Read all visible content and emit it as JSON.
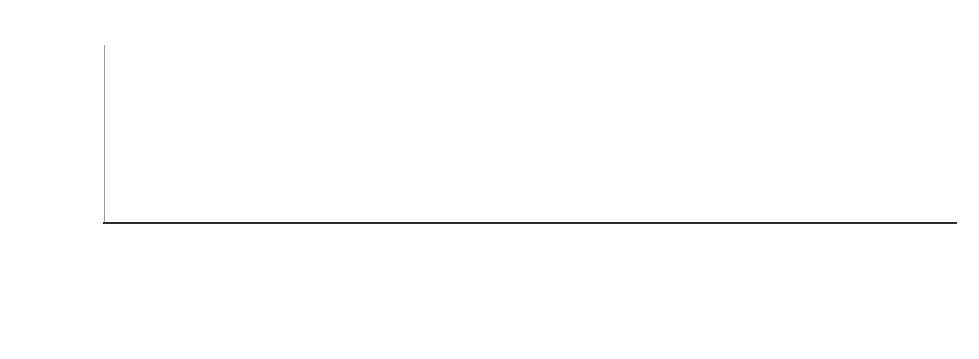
{
  "chart_data": {
    "type": "bar",
    "subtype": "stacked-bar-percent",
    "title": "",
    "xlabel": "",
    "ylabel": "",
    "ylim": [
      0,
      100
    ],
    "ytick_labels": [
      "0%",
      "20%",
      "40%",
      "60%",
      "80%",
      "100%"
    ],
    "ytick_values": [
      0,
      20,
      40,
      60,
      80,
      100
    ],
    "grid": false,
    "legend_position": "top-left",
    "categories": [
      "Zero Hunger",
      "Sustainable Cities and Communities",
      "Responsible Consumption and Production",
      "Reduced Inequalities",
      "Quality Education",
      "Peace, Justice and Strong Institutions",
      "Partnerships for the Goals",
      "No Poverty",
      "Life on Land",
      "Life Below Water",
      "Industry, Innovation and Infrastructure",
      "Good Health and Well Being",
      "Gender Equality",
      "Decent Work and Economic Growth",
      "Climate Action",
      "Clean Water and Sanitation",
      "Affordable and Clean Energy"
    ],
    "series": [
      {
        "name": "STEM",
        "color": "#808080",
        "values": [
          77,
          28,
          41,
          35,
          33,
          13,
          26,
          21,
          59,
          75,
          45,
          91,
          22,
          9,
          72,
          65,
          86
        ]
      },
      {
        "name": "SocSci",
        "color": "#a9a9a9",
        "values": [
          21,
          70,
          57,
          64,
          65,
          86,
          73,
          78,
          40,
          24,
          54,
          7,
          77,
          90,
          27,
          34,
          14
        ]
      },
      {
        "name": "SocSciSTEM",
        "color": "#bfbfbf",
        "values": [
          2,
          2,
          2,
          1,
          2,
          1,
          1,
          1,
          1,
          1,
          1,
          2,
          1,
          1,
          1,
          1,
          0
        ]
      }
    ]
  },
  "legend": {
    "entries": [
      {
        "label": "STEM",
        "color": "#808080"
      },
      {
        "label": "SocSci",
        "color": "#a9a9a9"
      },
      {
        "label": "SocSciSTEM",
        "color": "#bfbfbf"
      }
    ]
  }
}
